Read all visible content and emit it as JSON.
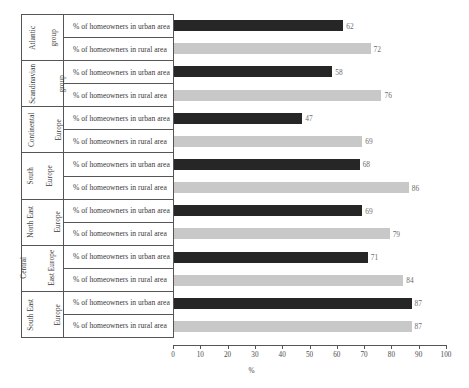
{
  "chart_data": {
    "type": "bar",
    "orientation": "horizontal",
    "title": "",
    "subtitle": "",
    "xlabel": "%",
    "ylabel": "",
    "xlim": [
      0,
      100
    ],
    "xticks": [
      0,
      10,
      20,
      30,
      40,
      50,
      60,
      70,
      80,
      90,
      100
    ],
    "xtick_labels": [
      "0",
      "10",
      "20",
      "30",
      "40",
      "50",
      "60",
      "70",
      "80",
      "90",
      "100"
    ],
    "grid": false,
    "legend": "none",
    "categories": [
      "Atlantic group",
      "Scandinavian group",
      "Continental Europe",
      "South Europe",
      "North East Europe",
      "Central East Europe",
      "South East Europe"
    ],
    "series": [
      {
        "name": "% of homeowners in urban area",
        "color": "#262626",
        "values": [
          62,
          58,
          47,
          68,
          69,
          71,
          87
        ]
      },
      {
        "name": "% of homeowners in rural area",
        "color": "#c8c8c8",
        "values": [
          72,
          76,
          69,
          86,
          79,
          84,
          87
        ]
      }
    ]
  },
  "groups": [
    {
      "name_lines": [
        "Atlantic",
        "group"
      ],
      "rows": [
        {
          "label": "% of homeowners in urban area",
          "value": "62",
          "series": 0
        },
        {
          "label": "% of homeowners in rural area",
          "value": "72",
          "series": 1
        }
      ]
    },
    {
      "name_lines": [
        "Scandinavian",
        "group"
      ],
      "rows": [
        {
          "label": "% of homeowners in urban area",
          "value": "58",
          "series": 0
        },
        {
          "label": "% of homeowners in rural area",
          "value": "76",
          "series": 1
        }
      ]
    },
    {
      "name_lines": [
        "Continental",
        "Europe"
      ],
      "rows": [
        {
          "label": "% of homeowners in urban area",
          "value": "47",
          "series": 0
        },
        {
          "label": "% of homeowners in rural area",
          "value": "69",
          "series": 1
        }
      ]
    },
    {
      "name_lines": [
        "South",
        "Europe"
      ],
      "rows": [
        {
          "label": "% of homeowners in urban area",
          "value": "68",
          "series": 0
        },
        {
          "label": "% of homeowners in rural area",
          "value": "86",
          "series": 1
        }
      ]
    },
    {
      "name_lines": [
        "North East",
        "Europe"
      ],
      "rows": [
        {
          "label": "% of homeowners in urban area",
          "value": "69",
          "series": 0
        },
        {
          "label": "% of homeowners in rural area",
          "value": "79",
          "series": 1
        }
      ]
    },
    {
      "name_lines": [
        "Central",
        "East Europe"
      ],
      "rows": [
        {
          "label": "% of homeowners in urban area",
          "value": "71",
          "series": 0
        },
        {
          "label": "% of homeowners in rural area",
          "value": "84",
          "series": 1
        }
      ]
    },
    {
      "name_lines": [
        "South East",
        "Europe"
      ],
      "rows": [
        {
          "label": "% of homeowners in urban area",
          "value": "87",
          "series": 0
        },
        {
          "label": "% of homeowners in rural area",
          "value": "87",
          "series": 1
        }
      ]
    }
  ],
  "axis": {
    "title": "%",
    "ticks": [
      "0",
      "10",
      "20",
      "30",
      "40",
      "50",
      "60",
      "70",
      "80",
      "90",
      "100"
    ]
  },
  "colors": {
    "urban_bar": "#262626",
    "rural_bar": "#c8c8c8",
    "axis_line": "#555555",
    "text": "#3a3a3a",
    "value_text": "#6d6d6d",
    "background": "#ffffff"
  }
}
